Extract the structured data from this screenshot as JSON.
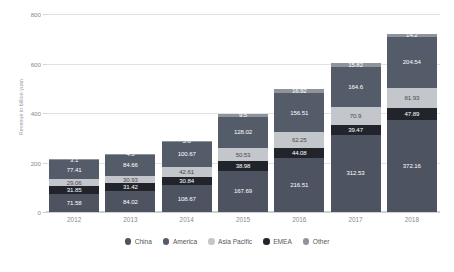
{
  "chart_data": {
    "type": "bar",
    "stacked": true,
    "title": "",
    "xlabel": "",
    "ylabel": "Revenue in billion yuan",
    "ylim": [
      0,
      800
    ],
    "yticks": [
      0,
      200,
      400,
      600,
      800
    ],
    "grid": true,
    "legend_position": "bottom",
    "categories": [
      "2012",
      "2013",
      "2014",
      "2015",
      "2016",
      "2017",
      "2018"
    ],
    "series": [
      {
        "name": "China",
        "color": "#4d5361",
        "text_tone": "dark",
        "values": [
          71.58,
          84.02,
          108.67,
          167.69,
          216.51,
          312.53,
          372.16
        ],
        "labels": [
          "71.58",
          "84.02",
          "108.67",
          "167.69",
          "216.51",
          "312.53",
          "372.16"
        ]
      },
      {
        "name": "EMEA",
        "color": "#21252b",
        "text_tone": "dark",
        "values": [
          31.85,
          31.42,
          30.84,
          38.98,
          44.08,
          39.47,
          47.89
        ],
        "labels": [
          "31.85",
          "31.42",
          "30.84",
          "38.98",
          "44.08",
          "39.47",
          "47.89"
        ]
      },
      {
        "name": "Asia Pacific",
        "color": "#c3c6cb",
        "text_tone": "light",
        "values": [
          29.06,
          30.93,
          42.61,
          50.53,
          62.25,
          70.9,
          81.93
        ],
        "labels": [
          "29.06",
          "30.93",
          "42.61",
          "50.53",
          "62.25",
          "70.9",
          "81.93"
        ]
      },
      {
        "name": "America",
        "color": "#545b69",
        "text_tone": "dark",
        "values": [
          77.41,
          84.66,
          100.67,
          128.02,
          156.51,
          164.6,
          204.54
        ],
        "labels": [
          "77.41",
          "84.66",
          "100.67",
          "128.02",
          "156.51",
          "164.6",
          "204.54"
        ]
      },
      {
        "name": "Other",
        "color": "#8f939b",
        "text_tone": "dark",
        "values": [
          3.1,
          4.5,
          5.6,
          9.5,
          16.92,
          15.82,
          14.2
        ],
        "labels": [
          "3.1",
          "4.5",
          "5.6",
          "9.5",
          "16.92",
          "15.82",
          "14.2"
        ]
      }
    ]
  }
}
